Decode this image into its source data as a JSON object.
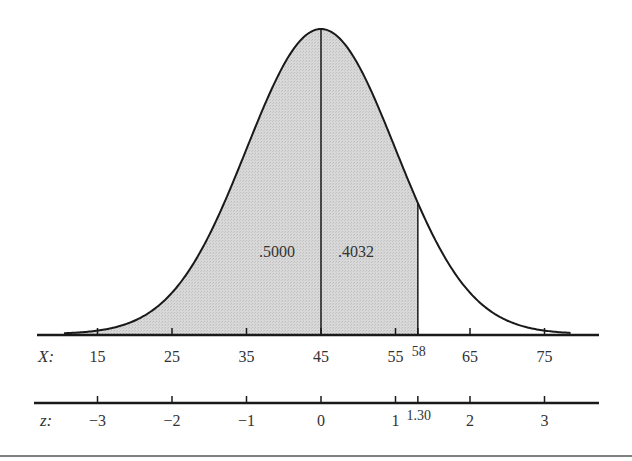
{
  "chart_data": {
    "type": "area",
    "title": "",
    "mean": 45,
    "sd": 10,
    "shaded_range": {
      "from_x": -999,
      "to_x": 58
    },
    "divider_x": 45,
    "area_labels": [
      {
        "text": ".5000",
        "region": "left of mean"
      },
      {
        "text": ".4032",
        "region": "between mean and X=58"
      }
    ],
    "axes": [
      {
        "name": "X",
        "label": "X:",
        "ticks": [
          {
            "value": 15,
            "label": "15"
          },
          {
            "value": 25,
            "label": "25"
          },
          {
            "value": 35,
            "label": "35"
          },
          {
            "value": 45,
            "label": "45"
          },
          {
            "value": 55,
            "label": "55"
          },
          {
            "value": 58,
            "label": "58",
            "raised": true
          },
          {
            "value": 65,
            "label": "65"
          },
          {
            "value": 75,
            "label": "75"
          }
        ]
      },
      {
        "name": "z",
        "label": "z:",
        "ticks": [
          {
            "value": -3,
            "label": "−3"
          },
          {
            "value": -2,
            "label": "−2"
          },
          {
            "value": -1,
            "label": "−1"
          },
          {
            "value": 0,
            "label": "0"
          },
          {
            "value": 1,
            "label": "1"
          },
          {
            "value": 1.3,
            "label": "1.30",
            "raised": true
          },
          {
            "value": 2,
            "label": "2"
          },
          {
            "value": 3,
            "label": "3"
          }
        ]
      }
    ],
    "xlim": [
      41.0,
      82.0
    ],
    "grid": false,
    "legend": null
  },
  "colors": {
    "fill": "#d4d4d4",
    "line": "#1a1a1a",
    "text": "#333333"
  }
}
